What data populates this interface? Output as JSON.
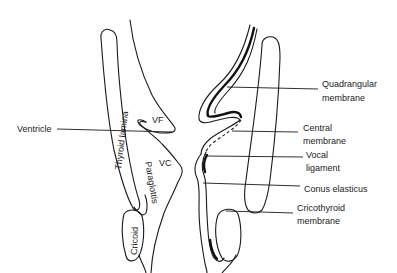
{
  "diagram": {
    "type": "anatomical-cross-section",
    "inner_labels": {
      "thyroid_lamina": "Thyroid lamina",
      "paraglottis": "Paraglottis",
      "cricoid": "Cricoid",
      "vf": "VF",
      "vc": "VC"
    },
    "callouts": {
      "ventricle": "Ventricle",
      "quadrangular_1": "Quadrangular",
      "quadrangular_2": "membrane",
      "central_1": "Central",
      "central_2": "membrane",
      "vocal_1": "Vocal",
      "vocal_2": "ligament",
      "conus": "Conus elasticus",
      "cricothyroid_1": "Cricothyroid",
      "cricothyroid_2": "membrane"
    }
  }
}
